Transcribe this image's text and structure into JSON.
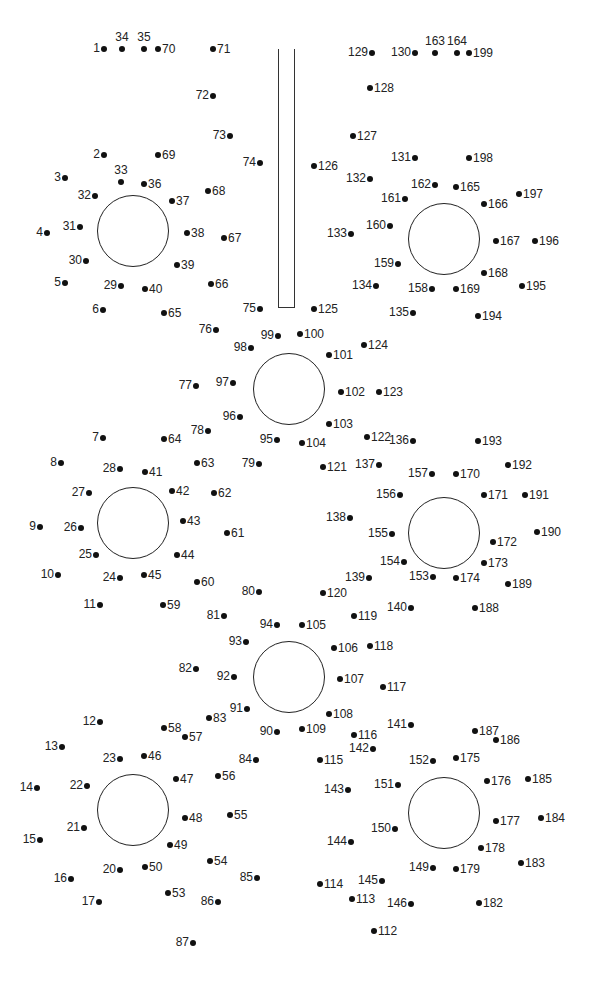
{
  "worksheet": {
    "type": "connect-the-dots",
    "ink_color": "#111111",
    "background": "#ffffff",
    "pole": {
      "x": 278,
      "y": 49,
      "width": 17,
      "height": 259
    },
    "circles": [
      {
        "cx": 133,
        "cy": 231,
        "r": 36
      },
      {
        "cx": 289,
        "cy": 389,
        "r": 36
      },
      {
        "cx": 444,
        "cy": 239,
        "r": 36
      },
      {
        "cx": 133,
        "cy": 523,
        "r": 36
      },
      {
        "cx": 289,
        "cy": 677,
        "r": 36
      },
      {
        "cx": 444,
        "cy": 533,
        "r": 36
      },
      {
        "cx": 133,
        "cy": 810,
        "r": 36
      },
      {
        "cx": 444,
        "cy": 813,
        "r": 36
      }
    ],
    "dots": [
      {
        "n": "1",
        "x": 104,
        "y": 49,
        "s": "l"
      },
      {
        "n": "34",
        "x": 122,
        "y": 49,
        "s": "t"
      },
      {
        "n": "35",
        "x": 144,
        "y": 49,
        "s": "t"
      },
      {
        "n": "70",
        "x": 158,
        "y": 49,
        "s": "r"
      },
      {
        "n": "71",
        "x": 213,
        "y": 49,
        "s": "r"
      },
      {
        "n": "72",
        "x": 213,
        "y": 96,
        "s": "l"
      },
      {
        "n": "73",
        "x": 230,
        "y": 136,
        "s": "l"
      },
      {
        "n": "74",
        "x": 260,
        "y": 163,
        "s": "l"
      },
      {
        "n": "2",
        "x": 104,
        "y": 155,
        "s": "l"
      },
      {
        "n": "69",
        "x": 158,
        "y": 155,
        "s": "r"
      },
      {
        "n": "3",
        "x": 65,
        "y": 178,
        "s": "l"
      },
      {
        "n": "33",
        "x": 121,
        "y": 182,
        "s": "t"
      },
      {
        "n": "36",
        "x": 144,
        "y": 184,
        "s": "r"
      },
      {
        "n": "68",
        "x": 208,
        "y": 191,
        "s": "r"
      },
      {
        "n": "32",
        "x": 95,
        "y": 196,
        "s": "l"
      },
      {
        "n": "37",
        "x": 172,
        "y": 201,
        "s": "r"
      },
      {
        "n": "4",
        "x": 47,
        "y": 233,
        "s": "l"
      },
      {
        "n": "31",
        "x": 80,
        "y": 227,
        "s": "l"
      },
      {
        "n": "38",
        "x": 187,
        "y": 233,
        "s": "r"
      },
      {
        "n": "67",
        "x": 224,
        "y": 238,
        "s": "r"
      },
      {
        "n": "30",
        "x": 86,
        "y": 261,
        "s": "l"
      },
      {
        "n": "39",
        "x": 177,
        "y": 265,
        "s": "r"
      },
      {
        "n": "5",
        "x": 65,
        "y": 283,
        "s": "l"
      },
      {
        "n": "29",
        "x": 121,
        "y": 286,
        "s": "l"
      },
      {
        "n": "40",
        "x": 145,
        "y": 289,
        "s": "r"
      },
      {
        "n": "66",
        "x": 211,
        "y": 284,
        "s": "r"
      },
      {
        "n": "6",
        "x": 103,
        "y": 310,
        "s": "l"
      },
      {
        "n": "65",
        "x": 164,
        "y": 313,
        "s": "r"
      },
      {
        "n": "75",
        "x": 260,
        "y": 309,
        "s": "l"
      },
      {
        "n": "76",
        "x": 216,
        "y": 330,
        "s": "l"
      },
      {
        "n": "99",
        "x": 278,
        "y": 336,
        "s": "l"
      },
      {
        "n": "100",
        "x": 300,
        "y": 334,
        "s": "r"
      },
      {
        "n": "98",
        "x": 251,
        "y": 348,
        "s": "l"
      },
      {
        "n": "101",
        "x": 329,
        "y": 355,
        "s": "r"
      },
      {
        "n": "124",
        "x": 364,
        "y": 345,
        "s": "r"
      },
      {
        "n": "77",
        "x": 196,
        "y": 386,
        "s": "l"
      },
      {
        "n": "97",
        "x": 233,
        "y": 383,
        "s": "l"
      },
      {
        "n": "102",
        "x": 341,
        "y": 392,
        "s": "r"
      },
      {
        "n": "123",
        "x": 379,
        "y": 392,
        "s": "r"
      },
      {
        "n": "96",
        "x": 240,
        "y": 417,
        "s": "l"
      },
      {
        "n": "78",
        "x": 208,
        "y": 431,
        "s": "l"
      },
      {
        "n": "103",
        "x": 329,
        "y": 424,
        "s": "r"
      },
      {
        "n": "7",
        "x": 103,
        "y": 438,
        "s": "l"
      },
      {
        "n": "64",
        "x": 164,
        "y": 439,
        "s": "r"
      },
      {
        "n": "95",
        "x": 277,
        "y": 440,
        "s": "l"
      },
      {
        "n": "104",
        "x": 302,
        "y": 443,
        "s": "r"
      },
      {
        "n": "122",
        "x": 367,
        "y": 437,
        "s": "r"
      },
      {
        "n": "136",
        "x": 413,
        "y": 441,
        "s": "l"
      },
      {
        "n": "193",
        "x": 478,
        "y": 441,
        "s": "r"
      },
      {
        "n": "8",
        "x": 61,
        "y": 463,
        "s": "l"
      },
      {
        "n": "28",
        "x": 120,
        "y": 469,
        "s": "l"
      },
      {
        "n": "41",
        "x": 145,
        "y": 472,
        "s": "r"
      },
      {
        "n": "63",
        "x": 197,
        "y": 463,
        "s": "r"
      },
      {
        "n": "79",
        "x": 259,
        "y": 464,
        "s": "l"
      },
      {
        "n": "121",
        "x": 323,
        "y": 467,
        "s": "r"
      },
      {
        "n": "137",
        "x": 379,
        "y": 465,
        "s": "l"
      },
      {
        "n": "157",
        "x": 432,
        "y": 474,
        "s": "l"
      },
      {
        "n": "170",
        "x": 456,
        "y": 474,
        "s": "r"
      },
      {
        "n": "192",
        "x": 508,
        "y": 465,
        "s": "r"
      },
      {
        "n": "27",
        "x": 89,
        "y": 493,
        "s": "l"
      },
      {
        "n": "42",
        "x": 172,
        "y": 491,
        "s": "r"
      },
      {
        "n": "62",
        "x": 214,
        "y": 493,
        "s": "r"
      },
      {
        "n": "156",
        "x": 400,
        "y": 495,
        "s": "l"
      },
      {
        "n": "171",
        "x": 484,
        "y": 495,
        "s": "r"
      },
      {
        "n": "191",
        "x": 525,
        "y": 495,
        "s": "r"
      },
      {
        "n": "138",
        "x": 350,
        "y": 518,
        "s": "l"
      },
      {
        "n": "9",
        "x": 40,
        "y": 527,
        "s": "l"
      },
      {
        "n": "26",
        "x": 81,
        "y": 528,
        "s": "l"
      },
      {
        "n": "43",
        "x": 183,
        "y": 521,
        "s": "r"
      },
      {
        "n": "61",
        "x": 227,
        "y": 533,
        "s": "r"
      },
      {
        "n": "155",
        "x": 392,
        "y": 534,
        "s": "l"
      },
      {
        "n": "190",
        "x": 537,
        "y": 532,
        "s": "r"
      },
      {
        "n": "172",
        "x": 493,
        "y": 542,
        "s": "r"
      },
      {
        "n": "25",
        "x": 96,
        "y": 555,
        "s": "l"
      },
      {
        "n": "44",
        "x": 177,
        "y": 555,
        "s": "r"
      },
      {
        "n": "154",
        "x": 404,
        "y": 562,
        "s": "l"
      },
      {
        "n": "173",
        "x": 484,
        "y": 563,
        "s": "r"
      },
      {
        "n": "10",
        "x": 58,
        "y": 575,
        "s": "l"
      },
      {
        "n": "24",
        "x": 120,
        "y": 578,
        "s": "l"
      },
      {
        "n": "45",
        "x": 144,
        "y": 575,
        "s": "r"
      },
      {
        "n": "60",
        "x": 197,
        "y": 582,
        "s": "r"
      },
      {
        "n": "139",
        "x": 369,
        "y": 578,
        "s": "l"
      },
      {
        "n": "153",
        "x": 433,
        "y": 577,
        "s": "l"
      },
      {
        "n": "174",
        "x": 456,
        "y": 578,
        "s": "r"
      },
      {
        "n": "189",
        "x": 508,
        "y": 584,
        "s": "r"
      },
      {
        "n": "80",
        "x": 259,
        "y": 592,
        "s": "l"
      },
      {
        "n": "120",
        "x": 323,
        "y": 593,
        "s": "r"
      },
      {
        "n": "11",
        "x": 100,
        "y": 605,
        "s": "l"
      },
      {
        "n": "59",
        "x": 163,
        "y": 605,
        "s": "r"
      },
      {
        "n": "140",
        "x": 411,
        "y": 608,
        "s": "l"
      },
      {
        "n": "188",
        "x": 475,
        "y": 608,
        "s": "r"
      },
      {
        "n": "81",
        "x": 224,
        "y": 616,
        "s": "l"
      },
      {
        "n": "119",
        "x": 354,
        "y": 616,
        "s": "r"
      },
      {
        "n": "94",
        "x": 277,
        "y": 625,
        "s": "l"
      },
      {
        "n": "105",
        "x": 302,
        "y": 625,
        "s": "r"
      },
      {
        "n": "93",
        "x": 246,
        "y": 642,
        "s": "l"
      },
      {
        "n": "106",
        "x": 334,
        "y": 648,
        "s": "r"
      },
      {
        "n": "118",
        "x": 370,
        "y": 646,
        "s": "r"
      },
      {
        "n": "82",
        "x": 196,
        "y": 669,
        "s": "l"
      },
      {
        "n": "92",
        "x": 234,
        "y": 677,
        "s": "l"
      },
      {
        "n": "107",
        "x": 340,
        "y": 679,
        "s": "r"
      },
      {
        "n": "117",
        "x": 383,
        "y": 687,
        "s": "r"
      },
      {
        "n": "91",
        "x": 247,
        "y": 709,
        "s": "l"
      },
      {
        "n": "108",
        "x": 329,
        "y": 714,
        "s": "r"
      },
      {
        "n": "83",
        "x": 209,
        "y": 718,
        "s": "r"
      },
      {
        "n": "12",
        "x": 100,
        "y": 722,
        "s": "l"
      },
      {
        "n": "58",
        "x": 164,
        "y": 728,
        "s": "r"
      },
      {
        "n": "57",
        "x": 185,
        "y": 737,
        "s": "r"
      },
      {
        "n": "141",
        "x": 411,
        "y": 725,
        "s": "l"
      },
      {
        "n": "187",
        "x": 475,
        "y": 731,
        "s": "r"
      },
      {
        "n": "186",
        "x": 496,
        "y": 740,
        "s": "r"
      },
      {
        "n": "90",
        "x": 277,
        "y": 732,
        "s": "l"
      },
      {
        "n": "109",
        "x": 302,
        "y": 729,
        "s": "r"
      },
      {
        "n": "116",
        "x": 354,
        "y": 735,
        "s": "r"
      },
      {
        "n": "13",
        "x": 62,
        "y": 747,
        "s": "l"
      },
      {
        "n": "142",
        "x": 373,
        "y": 749,
        "s": "l"
      },
      {
        "n": "23",
        "x": 120,
        "y": 759,
        "s": "l"
      },
      {
        "n": "46",
        "x": 144,
        "y": 756,
        "s": "r"
      },
      {
        "n": "84",
        "x": 256,
        "y": 760,
        "s": "l"
      },
      {
        "n": "115",
        "x": 320,
        "y": 760,
        "s": "r"
      },
      {
        "n": "152",
        "x": 433,
        "y": 761,
        "s": "l"
      },
      {
        "n": "175",
        "x": 456,
        "y": 758,
        "s": "r"
      },
      {
        "n": "56",
        "x": 218,
        "y": 776,
        "s": "r"
      },
      {
        "n": "47",
        "x": 176,
        "y": 779,
        "s": "r"
      },
      {
        "n": "176",
        "x": 487,
        "y": 781,
        "s": "r"
      },
      {
        "n": "185",
        "x": 528,
        "y": 779,
        "s": "r"
      },
      {
        "n": "14",
        "x": 37,
        "y": 788,
        "s": "l"
      },
      {
        "n": "22",
        "x": 87,
        "y": 786,
        "s": "l"
      },
      {
        "n": "151",
        "x": 398,
        "y": 785,
        "s": "l"
      },
      {
        "n": "143",
        "x": 348,
        "y": 790,
        "s": "l"
      },
      {
        "n": "48",
        "x": 185,
        "y": 818,
        "s": "r"
      },
      {
        "n": "55",
        "x": 230,
        "y": 815,
        "s": "r"
      },
      {
        "n": "177",
        "x": 496,
        "y": 821,
        "s": "r"
      },
      {
        "n": "184",
        "x": 541,
        "y": 818,
        "s": "r"
      },
      {
        "n": "21",
        "x": 84,
        "y": 828,
        "s": "l"
      },
      {
        "n": "150",
        "x": 395,
        "y": 829,
        "s": "l"
      },
      {
        "n": "15",
        "x": 40,
        "y": 840,
        "s": "l"
      },
      {
        "n": "144",
        "x": 351,
        "y": 842,
        "s": "l"
      },
      {
        "n": "49",
        "x": 170,
        "y": 845,
        "s": "r"
      },
      {
        "n": "178",
        "x": 481,
        "y": 848,
        "s": "r"
      },
      {
        "n": "54",
        "x": 210,
        "y": 861,
        "s": "r"
      },
      {
        "n": "183",
        "x": 521,
        "y": 863,
        "s": "r"
      },
      {
        "n": "20",
        "x": 120,
        "y": 870,
        "s": "l"
      },
      {
        "n": "50",
        "x": 145,
        "y": 867,
        "s": "r"
      },
      {
        "n": "149",
        "x": 433,
        "y": 868,
        "s": "l"
      },
      {
        "n": "179",
        "x": 456,
        "y": 869,
        "s": "r"
      },
      {
        "n": "85",
        "x": 257,
        "y": 878,
        "s": "l"
      },
      {
        "n": "16",
        "x": 71,
        "y": 879,
        "s": "l"
      },
      {
        "n": "145",
        "x": 382,
        "y": 881,
        "s": "l"
      },
      {
        "n": "114",
        "x": 320,
        "y": 884,
        "s": "r"
      },
      {
        "n": "53",
        "x": 168,
        "y": 893,
        "s": "r"
      },
      {
        "n": "113",
        "x": 352,
        "y": 899,
        "s": "r"
      },
      {
        "n": "17",
        "x": 99,
        "y": 902,
        "s": "l"
      },
      {
        "n": "86",
        "x": 218,
        "y": 902,
        "s": "l"
      },
      {
        "n": "146",
        "x": 411,
        "y": 904,
        "s": "l"
      },
      {
        "n": "182",
        "x": 479,
        "y": 903,
        "s": "r"
      },
      {
        "n": "112",
        "x": 374,
        "y": 931,
        "s": "r"
      },
      {
        "n": "87",
        "x": 193,
        "y": 943,
        "s": "l"
      },
      {
        "n": "125",
        "x": 314,
        "y": 309,
        "s": "r"
      },
      {
        "n": "126",
        "x": 314,
        "y": 166,
        "s": "r"
      },
      {
        "n": "127",
        "x": 353,
        "y": 136,
        "s": "r"
      },
      {
        "n": "128",
        "x": 370,
        "y": 88,
        "s": "r"
      },
      {
        "n": "129",
        "x": 372,
        "y": 53,
        "s": "l"
      },
      {
        "n": "130",
        "x": 415,
        "y": 53,
        "s": "l"
      },
      {
        "n": "163",
        "x": 435,
        "y": 53,
        "s": "t"
      },
      {
        "n": "164",
        "x": 457,
        "y": 53,
        "s": "t"
      },
      {
        "n": "199",
        "x": 469,
        "y": 53,
        "s": "r"
      },
      {
        "n": "131",
        "x": 415,
        "y": 158,
        "s": "l"
      },
      {
        "n": "198",
        "x": 469,
        "y": 158,
        "s": "r"
      },
      {
        "n": "132",
        "x": 370,
        "y": 179,
        "s": "l"
      },
      {
        "n": "162",
        "x": 435,
        "y": 185,
        "s": "l"
      },
      {
        "n": "165",
        "x": 456,
        "y": 187,
        "s": "r"
      },
      {
        "n": "197",
        "x": 519,
        "y": 194,
        "s": "r"
      },
      {
        "n": "161",
        "x": 405,
        "y": 199,
        "s": "l"
      },
      {
        "n": "166",
        "x": 484,
        "y": 204,
        "s": "r"
      },
      {
        "n": "160",
        "x": 390,
        "y": 226,
        "s": "l"
      },
      {
        "n": "133",
        "x": 351,
        "y": 234,
        "s": "l"
      },
      {
        "n": "167",
        "x": 496,
        "y": 241,
        "s": "r"
      },
      {
        "n": "196",
        "x": 535,
        "y": 241,
        "s": "r"
      },
      {
        "n": "159",
        "x": 398,
        "y": 264,
        "s": "l"
      },
      {
        "n": "168",
        "x": 484,
        "y": 273,
        "s": "r"
      },
      {
        "n": "134",
        "x": 376,
        "y": 286,
        "s": "l"
      },
      {
        "n": "158",
        "x": 432,
        "y": 289,
        "s": "l"
      },
      {
        "n": "169",
        "x": 456,
        "y": 289,
        "s": "r"
      },
      {
        "n": "195",
        "x": 522,
        "y": 286,
        "s": "r"
      },
      {
        "n": "135",
        "x": 413,
        "y": 313,
        "s": "l"
      },
      {
        "n": "194",
        "x": 478,
        "y": 316,
        "s": "r"
      }
    ]
  }
}
